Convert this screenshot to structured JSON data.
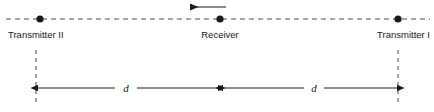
{
  "figure": {
    "type": "physics-schematic",
    "background_color": "#ffffff",
    "line_color": "#1a1a1a",
    "dash_color": "#4d4d4d",
    "axis": {
      "style": "dashed",
      "y": 19,
      "x_start": 6,
      "x_end": 430
    },
    "nodes": [
      {
        "id": "transmitter-two",
        "label": "Transmitter II",
        "x": 40,
        "y": 19,
        "label_x": 8,
        "label_anchor": "start",
        "marker": "filled-circle",
        "marker_radius": 3.6
      },
      {
        "id": "receiver",
        "label": "Receiver",
        "x": 220,
        "y": 19,
        "label_x": 220,
        "label_anchor": "middle",
        "marker": "filled-circle",
        "marker_radius": 3.6
      },
      {
        "id": "transmitter-one",
        "label": "Transmitter I",
        "x": 398,
        "y": 19,
        "label_x": 430,
        "label_anchor": "end",
        "marker": "filled-circle",
        "marker_radius": 3.6
      }
    ],
    "label_baseline_y": 38,
    "motion_arrow": {
      "id": "receiver-velocity-arrow",
      "direction": "left",
      "x_tail": 226,
      "x_head": 190,
      "y": 7
    },
    "extension_lines": [
      {
        "id": "left-extension-line",
        "x": 36,
        "y_top": 50,
        "y_bottom": 106
      },
      {
        "id": "right-extension-line",
        "x": 398,
        "y_top": 50,
        "y_bottom": 106
      }
    ],
    "dimensions": [
      {
        "id": "dimension-left",
        "label": "d",
        "y": 88,
        "x_start": 38,
        "x_end": 218,
        "label_x": 126,
        "gap_half_width": 11
      },
      {
        "id": "dimension-right",
        "label": "d",
        "y": 88,
        "x_start": 223,
        "x_end": 397,
        "label_x": 314,
        "gap_half_width": 10
      }
    ]
  }
}
